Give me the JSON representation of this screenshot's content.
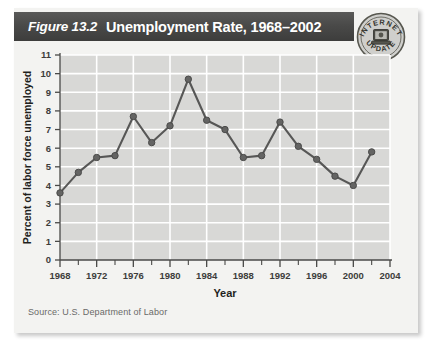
{
  "figure": {
    "number": "Figure 13.2",
    "title": "Unemployment Rate, 1968–2002",
    "source": "Source: U.S. Department of Labor"
  },
  "badge": {
    "top_text": "INTERNET",
    "bottom_text": "UPDATE",
    "icon": "computer-icon"
  },
  "colors": {
    "banner_dark": "#46463f",
    "card_background": "#f3f3f1",
    "plot_background": "#d8d8d6",
    "gridline": "#ffffff",
    "series_line": "#575756",
    "marker_fill": "#646463",
    "axis": "#4a4a48",
    "tick_label": "#3d3d3b",
    "source_text": "#6a6a68"
  },
  "chart_data": {
    "type": "line",
    "title": "Unemployment Rate, 1968–2002",
    "xlabel": "Year",
    "ylabel": "Percent of labor force unemployed",
    "xlim": [
      1968,
      2004
    ],
    "ylim": [
      0,
      11
    ],
    "grid": true,
    "legend": "none",
    "y_ticks": [
      0,
      1,
      2,
      3,
      4,
      5,
      6,
      7,
      8,
      9,
      10,
      11
    ],
    "x_ticks": [
      1968,
      1972,
      1976,
      1980,
      1984,
      1988,
      1992,
      1996,
      2000,
      2004
    ],
    "x_minor_ticks": [
      1970,
      1974,
      1978,
      1982,
      1986,
      1990,
      1994,
      1998,
      2002
    ],
    "x": [
      1968,
      1970,
      1972,
      1974,
      1976,
      1978,
      1980,
      1982,
      1984,
      1986,
      1988,
      1990,
      1992,
      1994,
      1996,
      1998,
      2000,
      2002
    ],
    "values": [
      3.6,
      4.7,
      5.5,
      5.6,
      7.7,
      6.3,
      7.2,
      9.7,
      7.5,
      7.0,
      5.5,
      5.6,
      7.4,
      6.1,
      5.4,
      4.5,
      4.0,
      5.8
    ],
    "series": [
      {
        "name": "Percent of labor force unemployed",
        "values": [
          3.6,
          4.7,
          5.5,
          5.6,
          7.7,
          6.3,
          7.2,
          9.7,
          7.5,
          7.0,
          5.5,
          5.6,
          7.4,
          6.1,
          5.4,
          4.5,
          4.0,
          5.8
        ]
      }
    ]
  }
}
